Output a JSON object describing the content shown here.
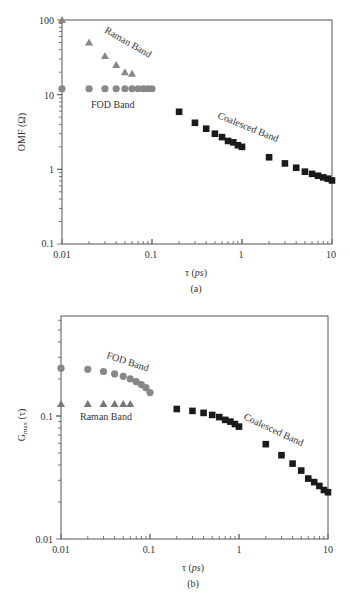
{
  "chart_data": [
    {
      "id": "a",
      "type": "scatter",
      "caption": "(a)",
      "xlabel": "τ (ps)",
      "ylabel": "OMF (Ω)",
      "xscale": "log",
      "yscale": "log",
      "xlim": [
        0.01,
        10
      ],
      "ylim": [
        0.1,
        100
      ],
      "xticks": [
        "0.01",
        "0.1",
        "1",
        "10"
      ],
      "yticks": [
        "0.1",
        "1",
        "10",
        "100"
      ],
      "grid": false,
      "series": [
        {
          "name": "Raman Band",
          "marker": "triangle",
          "color": "#888888",
          "x": [
            0.01,
            0.02,
            0.03,
            0.04,
            0.05,
            0.06
          ],
          "y": [
            100,
            50,
            33,
            25,
            20,
            19
          ]
        },
        {
          "name": "FOD Band",
          "marker": "circle",
          "color": "#888888",
          "x": [
            0.01,
            0.02,
            0.03,
            0.04,
            0.05,
            0.06,
            0.07,
            0.08,
            0.09,
            0.1
          ],
          "y": [
            12,
            12,
            12,
            12,
            12,
            12,
            12,
            12,
            12,
            12
          ]
        },
        {
          "name": "Coalesced Band",
          "marker": "square",
          "color": "#1a1a1a",
          "x": [
            0.2,
            0.3,
            0.4,
            0.5,
            0.6,
            0.7,
            0.8,
            0.9,
            1,
            2,
            3,
            4,
            5,
            6,
            7,
            8,
            9,
            10
          ],
          "y": [
            5.9,
            4.2,
            3.5,
            3.0,
            2.7,
            2.4,
            2.3,
            2.1,
            2.0,
            1.45,
            1.2,
            1.05,
            0.93,
            0.87,
            0.82,
            0.78,
            0.75,
            0.71
          ]
        }
      ],
      "annotations": [
        {
          "text": "Raman Band",
          "rotation": 30
        },
        {
          "text": "FOD Band",
          "rotation": 0
        },
        {
          "text": "Coalesced Band",
          "rotation": 22
        }
      ]
    },
    {
      "id": "b",
      "type": "scatter",
      "caption": "(b)",
      "xlabel": "τ (ps)",
      "ylabel": "Gmax (τ)",
      "xscale": "log",
      "yscale": "log",
      "xlim": [
        0.01,
        10
      ],
      "ylim": [
        0.01,
        0.65
      ],
      "xticks": [
        "0.01",
        "0.1",
        "1",
        "10"
      ],
      "yticks": [
        "0.01",
        "0.1"
      ],
      "grid": false,
      "series": [
        {
          "name": "FOD Band",
          "marker": "circle",
          "color": "#888888",
          "x": [
            0.01,
            0.02,
            0.03,
            0.04,
            0.05,
            0.06,
            0.07,
            0.08,
            0.09,
            0.1
          ],
          "y": [
            0.245,
            0.24,
            0.23,
            0.22,
            0.21,
            0.2,
            0.19,
            0.18,
            0.17,
            0.155
          ]
        },
        {
          "name": "Raman Band",
          "marker": "triangle",
          "color": "#777777",
          "x": [
            0.01,
            0.02,
            0.03,
            0.04,
            0.05,
            0.06
          ],
          "y": [
            0.125,
            0.125,
            0.125,
            0.125,
            0.125,
            0.125
          ]
        },
        {
          "name": "Coalesced Band",
          "marker": "square",
          "color": "#1a1a1a",
          "x": [
            0.2,
            0.3,
            0.4,
            0.5,
            0.6,
            0.7,
            0.8,
            0.9,
            1,
            2,
            3,
            4,
            5,
            6,
            7,
            8,
            9,
            10
          ],
          "y": [
            0.114,
            0.11,
            0.106,
            0.102,
            0.098,
            0.093,
            0.09,
            0.086,
            0.082,
            0.059,
            0.048,
            0.041,
            0.036,
            0.031,
            0.029,
            0.027,
            0.025,
            0.024
          ]
        }
      ],
      "annotations": [
        {
          "text": "FOD Band",
          "rotation": 18
        },
        {
          "text": "Raman Band",
          "rotation": 0
        },
        {
          "text": "Coalesced Band",
          "rotation": 25
        }
      ]
    }
  ],
  "labels": {
    "a": {
      "caption": "(a)",
      "xlabel_tau": "τ (",
      "xlabel_ps": "ps",
      "xlabel_close": ")",
      "ylabel": "OMF (Ω)",
      "raman": "Raman Band",
      "fod": "FOD Band",
      "coalesced": "Coalesced Band",
      "xticks": [
        "0.01",
        "0.1",
        "1",
        "10"
      ],
      "yticks": [
        "0.1",
        "1",
        "10",
        "100"
      ]
    },
    "b": {
      "caption": "(b)",
      "xlabel_tau": "τ (",
      "xlabel_ps": "ps",
      "xlabel_close": ")",
      "ylabel_main": "G",
      "ylabel_sub": "max",
      "ylabel_arg": " (τ)",
      "raman": "Raman Band",
      "fod": "FOD Band",
      "coalesced": "Coalesced Band",
      "xticks": [
        "0.01",
        "0.1",
        "1",
        "10"
      ],
      "yticks": [
        "0.01",
        "0.1"
      ]
    }
  }
}
